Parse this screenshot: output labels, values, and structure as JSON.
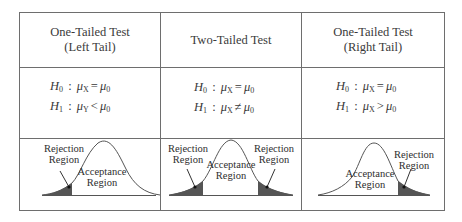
{
  "table": {
    "columns": [
      {
        "header_line1": "One-Tailed Test",
        "header_line2": "(Left Tail)",
        "h0": {
          "lhs": "H",
          "lhs_sub": "0",
          "param": "μ",
          "param_sub": "X",
          "op": "=",
          "rhs": "μ",
          "rhs_sub": "0"
        },
        "h1": {
          "lhs": "H",
          "lhs_sub": "1",
          "param": "μ",
          "param_sub": "Y",
          "op": "<",
          "rhs": "μ",
          "rhs_sub": "0"
        },
        "plot": {
          "tail": "left",
          "rejection_label_line1": "Rejection",
          "rejection_label_line2": "Region",
          "acceptance_label_line1": "Acceptance",
          "acceptance_label_line2": "Region"
        }
      },
      {
        "header_line1": "Two-Tailed Test",
        "header_line2": "",
        "h0": {
          "lhs": "H",
          "lhs_sub": "0",
          "param": "μ",
          "param_sub": "X",
          "op": "=",
          "rhs": "μ",
          "rhs_sub": "0"
        },
        "h1": {
          "lhs": "H",
          "lhs_sub": "1",
          "param": "μ",
          "param_sub": "X",
          "op": "≠",
          "rhs": "μ",
          "rhs_sub": "0"
        },
        "plot": {
          "tail": "both",
          "rejection_left_line1": "Rejection",
          "rejection_left_line2": "Region",
          "rejection_right_line1": "Rejection",
          "rejection_right_line2": "Region",
          "acceptance_label_line1": "Acceptance",
          "acceptance_label_line2": "Region"
        }
      },
      {
        "header_line1": "One-Tailed Test",
        "header_line2": "(Right Tail)",
        "h0": {
          "lhs": "H",
          "lhs_sub": "0",
          "param": "μ",
          "param_sub": "X",
          "op": "=",
          "rhs": "μ",
          "rhs_sub": "0"
        },
        "h1": {
          "lhs": "H",
          "lhs_sub": "1",
          "param": "μ",
          "param_sub": "X",
          "op": ">",
          "rhs": "μ",
          "rhs_sub": "0"
        },
        "plot": {
          "tail": "right",
          "rejection_label_line1": "Rejection",
          "rejection_label_line2": "Region",
          "acceptance_label_line1": "Acceptance",
          "acceptance_label_line2": "Region"
        }
      }
    ]
  },
  "colors": {
    "border": "#6e6e6e",
    "curve": "#555555",
    "shading": "#555555",
    "text": "#333333"
  }
}
